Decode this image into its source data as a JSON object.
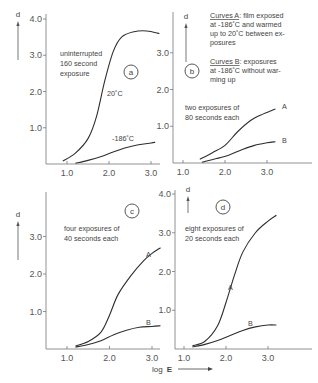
{
  "figure": {
    "xaxis_label": "log",
    "xaxis_label_bold": "E",
    "yaxis_label": "d",
    "legend": {
      "a_title": "Curves A",
      "a_lines": [
        ": film exposed",
        "at -186˚C and warmed",
        "up to 20˚C between ex-",
        "posures"
      ],
      "b_title": "Curves B",
      "b_lines": [
        ": exposures",
        "at -186˚C without war-",
        "ming up"
      ]
    }
  },
  "chart_data": [
    {
      "type": "line",
      "panel": "a",
      "annotation": [
        "uninterrupted",
        "160 second",
        "exposure"
      ],
      "xlabel": "",
      "ylabel": "d",
      "x_ticks": [
        "1.0",
        "2.0",
        "3.0"
      ],
      "y_ticks": [
        "1.0",
        "2.0",
        "3.0",
        "4.0"
      ],
      "xlim": [
        0.5,
        3.4
      ],
      "ylim": [
        0,
        4.0
      ],
      "series": [
        {
          "name": "20˚C",
          "points": [
            [
              0.9,
              0.08
            ],
            [
              1.2,
              0.3
            ],
            [
              1.5,
              0.7
            ],
            [
              1.7,
              1.3
            ],
            [
              1.9,
              2.3
            ],
            [
              2.1,
              3.1
            ],
            [
              2.3,
              3.5
            ],
            [
              2.6,
              3.65
            ],
            [
              2.9,
              3.67
            ],
            [
              3.2,
              3.6
            ]
          ]
        },
        {
          "name": "-186˚C",
          "points": [
            [
              1.2,
              0.02
            ],
            [
              1.5,
              0.1
            ],
            [
              1.8,
              0.2
            ],
            [
              2.1,
              0.33
            ],
            [
              2.4,
              0.45
            ],
            [
              2.7,
              0.53
            ],
            [
              3.0,
              0.58
            ],
            [
              3.1,
              0.6
            ]
          ]
        }
      ]
    },
    {
      "type": "line",
      "panel": "b",
      "annotation": [
        "two exposures of",
        "80 seconds each"
      ],
      "xlabel": "",
      "ylabel": "d",
      "x_ticks": [
        "1.0",
        "2.0",
        "3.0"
      ],
      "y_ticks": [
        "1.0",
        "2.0",
        "3.0"
      ],
      "xlim": [
        0.8,
        3.8
      ],
      "ylim": [
        0,
        4.1
      ],
      "series": [
        {
          "name": "A",
          "points": [
            [
              1.4,
              0.1
            ],
            [
              1.7,
              0.28
            ],
            [
              2.0,
              0.48
            ],
            [
              2.3,
              0.85
            ],
            [
              2.6,
              1.15
            ],
            [
              2.9,
              1.33
            ],
            [
              3.1,
              1.42
            ],
            [
              3.2,
              1.47
            ]
          ]
        },
        {
          "name": "B",
          "points": [
            [
              1.45,
              0.02
            ],
            [
              1.8,
              0.12
            ],
            [
              2.1,
              0.22
            ],
            [
              2.4,
              0.36
            ],
            [
              2.7,
              0.48
            ],
            [
              3.0,
              0.55
            ],
            [
              3.2,
              0.58
            ]
          ]
        }
      ]
    },
    {
      "type": "line",
      "panel": "c",
      "annotation": [
        "four exposures of",
        "40 seconds each"
      ],
      "xlabel": "",
      "ylabel": "d",
      "x_ticks": [
        "1.0",
        "2.0",
        "3.0"
      ],
      "y_ticks": [
        "1.0",
        "2.0",
        "3.0"
      ],
      "xlim": [
        0.5,
        3.4
      ],
      "ylim": [
        0,
        4.0
      ],
      "series": [
        {
          "name": "A",
          "points": [
            [
              1.2,
              0.08
            ],
            [
              1.5,
              0.2
            ],
            [
              1.8,
              0.45
            ],
            [
              2.0,
              0.9
            ],
            [
              2.2,
              1.45
            ],
            [
              2.5,
              1.95
            ],
            [
              2.8,
              2.35
            ],
            [
              3.0,
              2.55
            ],
            [
              3.2,
              2.7
            ]
          ]
        },
        {
          "name": "B",
          "points": [
            [
              1.2,
              0.05
            ],
            [
              1.5,
              0.12
            ],
            [
              1.8,
              0.22
            ],
            [
              2.1,
              0.38
            ],
            [
              2.4,
              0.5
            ],
            [
              2.7,
              0.58
            ],
            [
              3.0,
              0.6
            ],
            [
              3.2,
              0.62
            ]
          ]
        }
      ]
    },
    {
      "type": "line",
      "panel": "d",
      "annotation": [
        "eight exposures of",
        "20 seconds each"
      ],
      "xlabel": "log E",
      "ylabel": "d",
      "x_ticks": [
        "1.0",
        "2.0",
        "3.0"
      ],
      "y_ticks": [
        "1.0",
        "2.0",
        "3.0",
        "4.0"
      ],
      "xlim": [
        0.8,
        3.8
      ],
      "ylim": [
        0,
        4.0
      ],
      "series": [
        {
          "name": "A",
          "points": [
            [
              1.2,
              0.08
            ],
            [
              1.5,
              0.2
            ],
            [
              1.8,
              0.6
            ],
            [
              2.0,
              1.2
            ],
            [
              2.2,
              1.9
            ],
            [
              2.4,
              2.5
            ],
            [
              2.7,
              3.0
            ],
            [
              3.0,
              3.3
            ],
            [
              3.2,
              3.45
            ]
          ]
        },
        {
          "name": "B",
          "points": [
            [
              1.2,
              0.05
            ],
            [
              1.5,
              0.12
            ],
            [
              1.8,
              0.22
            ],
            [
              2.1,
              0.35
            ],
            [
              2.4,
              0.48
            ],
            [
              2.7,
              0.57
            ],
            [
              3.0,
              0.62
            ],
            [
              3.2,
              0.62
            ]
          ]
        }
      ]
    }
  ]
}
